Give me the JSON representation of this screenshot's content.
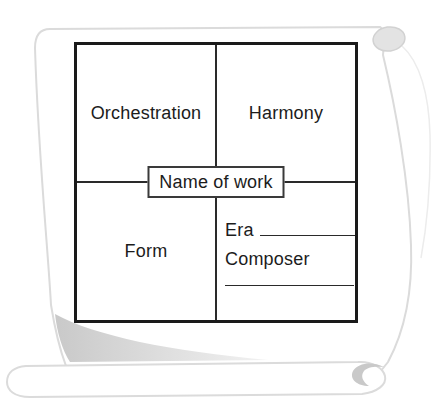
{
  "figure": {
    "center_label": "Name of work",
    "quadrants": {
      "top_left": "Orchestration",
      "top_right": "Harmony",
      "bottom_left": "Form",
      "bottom_right": {
        "era_label": "Era",
        "composer_label": "Composer"
      }
    }
  },
  "graphics": {
    "background_shape": "parchment-scroll"
  },
  "colors": {
    "frame_border": "#1a1a1a",
    "divider": "#2a2a2a",
    "text": "#1c1c1c",
    "scroll_outline": "#dbdbdb",
    "scroll_curl_fill": "#e3e3e3",
    "scroll_shading": "#c9c9c9",
    "background": "#ffffff"
  }
}
